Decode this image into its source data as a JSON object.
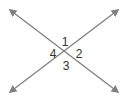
{
  "diagram": {
    "type": "intersecting-lines",
    "line_color": "#808080",
    "label_color": "#333333",
    "lines": [
      {
        "name": "line-a",
        "from": [
          10,
          10
        ],
        "to": [
          118,
          92
        ]
      },
      {
        "name": "line-b",
        "from": [
          10,
          92
        ],
        "to": [
          118,
          10
        ]
      }
    ],
    "intersection": [
      65,
      53
    ],
    "angle_labels": [
      {
        "text": "1",
        "x": 65,
        "y": 46
      },
      {
        "text": "2",
        "x": 79,
        "y": 58
      },
      {
        "text": "3",
        "x": 66,
        "y": 70
      },
      {
        "text": "4",
        "x": 53,
        "y": 58
      }
    ]
  }
}
